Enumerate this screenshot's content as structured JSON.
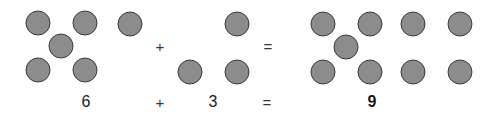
{
  "colors": {
    "dot_fill": "#8c8c8c",
    "dot_border": "#3a3a3a",
    "text": "#1a1a1a"
  },
  "equation": {
    "addend1": "6",
    "plus": "+",
    "addend2": "3",
    "equals": "=",
    "sum": "9"
  },
  "groups": {
    "addend1_dots": [
      {
        "x": 38,
        "y": 23
      },
      {
        "x": 85,
        "y": 23
      },
      {
        "x": 61,
        "y": 46
      },
      {
        "x": 38,
        "y": 70
      },
      {
        "x": 85,
        "y": 70
      },
      {
        "x": 130,
        "y": 24
      }
    ],
    "addend2_dots": [
      {
        "x": 237,
        "y": 24
      },
      {
        "x": 190,
        "y": 72
      },
      {
        "x": 237,
        "y": 72
      }
    ],
    "sum_dots": [
      {
        "x": 323,
        "y": 24
      },
      {
        "x": 370,
        "y": 24
      },
      {
        "x": 346,
        "y": 47
      },
      {
        "x": 323,
        "y": 72
      },
      {
        "x": 370,
        "y": 72
      },
      {
        "x": 413,
        "y": 24
      },
      {
        "x": 460,
        "y": 24
      },
      {
        "x": 413,
        "y": 72
      },
      {
        "x": 460,
        "y": 72
      }
    ]
  }
}
